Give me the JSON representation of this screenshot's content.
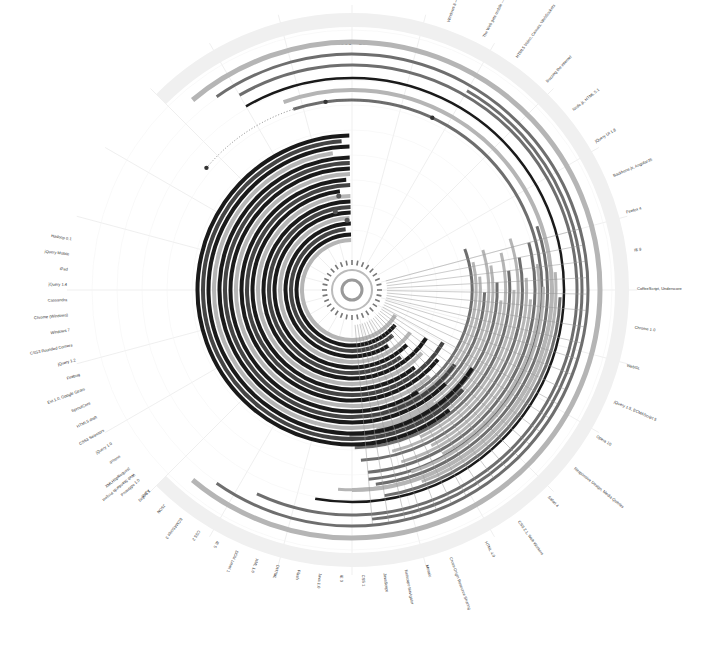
{
  "header": {
    "title": "1991 - 2012"
  },
  "chart_data": {
    "type": "radial-timeline",
    "title": "1991 - 2012",
    "center": [
      352,
      290
    ],
    "time_range": [
      1991,
      2012
    ],
    "colors": {
      "ring_bg": "#f0f0f0",
      "dark": "#1a1a1a",
      "mid": "#6e6e6e",
      "light": "#b5b5b5",
      "grid": "#e4e4e4"
    },
    "left_labels": [
      "Hadoop 0.1",
      "jQuery Mobile",
      "iPad",
      "jQuery 1.4",
      "Cassandra",
      "Chrome (Windows)",
      "Windows 7",
      "CSS3 Rounded Corners",
      "jQuery 1.2",
      "Firebug",
      "Ext 1.0, Google Gears",
      "SproutCore",
      "HTML5 draft",
      "CSS3 Selectors",
      "jQuery 1.0",
      "iPhone",
      "XMLHttpRequest",
      "Prototype 1.0",
      "Dojo 0.1"
    ],
    "right_labels": [
      "Windows 8 — Windows Phone 8",
      "The Web gets mobile — iPhone",
      "HTML5 Video, Canvas, WebSockets",
      "Buzzing the internet",
      "Node.js, HTML 5.1",
      "jQuery UI 1.8",
      "Backbone.js, AngularJS",
      "Firefox 4",
      "IE 9",
      "CoffeeScript, Underscore",
      "Chrome 1.0",
      "WebGL",
      "jQuery 1.5, ECMAScript 5",
      "Opera 10",
      "Responsive Design, Media Queries",
      "Safari 4",
      "CSS 2.1, Web Workers",
      "HTML 4.0",
      "Cross-Origin Resource Sharing"
    ],
    "bottom_labels": [
      "Mosaic",
      "Netscape Navigator",
      "JavaScript",
      "CSS 1",
      "IE 3",
      "Java 1.0",
      "Flash",
      "DHTML",
      "XML 1.0",
      "DOM Level 1",
      "IE 5",
      "CSS 2",
      "ECMAScript 3",
      "JSON",
      "AJAX",
      "Web Standards Project"
    ],
    "milestones_top": [
      "1995",
      "1999",
      "2004",
      "2009"
    ],
    "center_label": "1991"
  }
}
